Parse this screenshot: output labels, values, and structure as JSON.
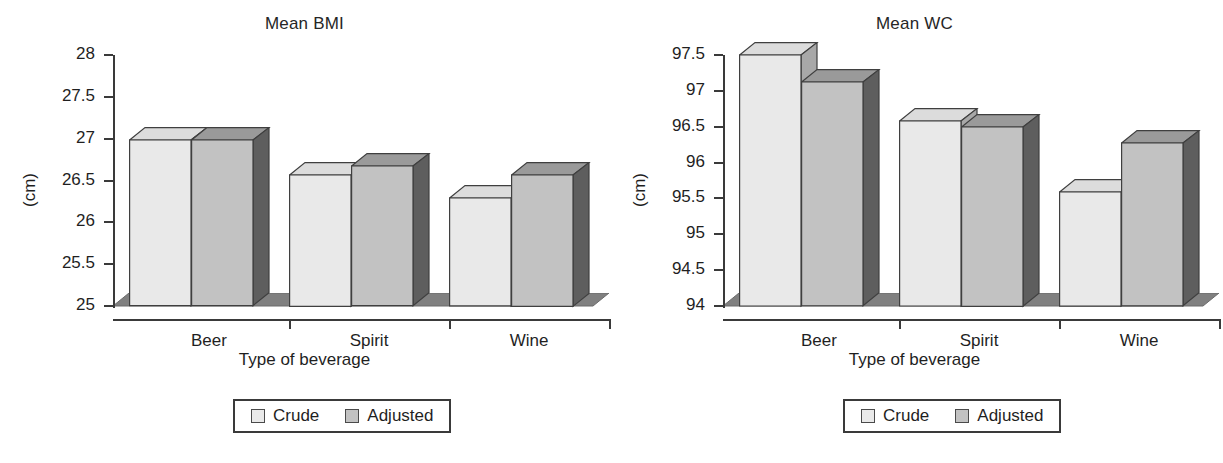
{
  "figure": {
    "width": 1219,
    "height": 463,
    "background": "#ffffff"
  },
  "colors": {
    "crude_face": "#e9e9e9",
    "crude_side": "#a8a8a8",
    "crude_top": "#dcdcdc",
    "adjusted_face": "#c2c2c2",
    "adjusted_side": "#5e5e5e",
    "adjusted_top": "#9a9a9a",
    "axis": "#3a3a3a",
    "text": "#1f1f1f",
    "floor_front": "#d6d6d6",
    "floor_side": "#808080"
  },
  "legend": {
    "entries": [
      {
        "label": "Crude",
        "swatch": "crude"
      },
      {
        "label": "Adjusted",
        "swatch": "adjusted"
      }
    ]
  },
  "chart_data": [
    {
      "id": "bmi",
      "type": "bar",
      "title": "Mean BMI",
      "xlabel": "Type of beverage",
      "ylabel": "(cm)",
      "categories": [
        "Beer",
        "Spirit",
        "Wine"
      ],
      "yticks": [
        25,
        25.5,
        26,
        26.5,
        27,
        27.5,
        28
      ],
      "ytick_labels": [
        "25",
        "25.5",
        "26",
        "26.5",
        "27",
        "27.5",
        "28"
      ],
      "ylim": [
        25,
        28
      ],
      "grid": false,
      "legend_position": "bottom-center",
      "series": [
        {
          "name": "Crude",
          "values": [
            26.98,
            26.57,
            26.29
          ]
        },
        {
          "name": "Adjusted",
          "values": [
            26.98,
            26.67,
            26.57
          ]
        }
      ]
    },
    {
      "id": "wc",
      "type": "bar",
      "title": "Mean WC",
      "xlabel": "Type of beverage",
      "ylabel": "(cm)",
      "categories": [
        "Beer",
        "Spirit",
        "Wine"
      ],
      "yticks": [
        94,
        94.5,
        95,
        95.5,
        96,
        96.5,
        97,
        97.5
      ],
      "ytick_labels": [
        "94",
        "94.5",
        "95",
        "95.5",
        "96",
        "96.5",
        "97",
        "97.5"
      ],
      "ylim": [
        94,
        97.5
      ],
      "grid": false,
      "legend_position": "bottom-center",
      "series": [
        {
          "name": "Crude",
          "values": [
            97.5,
            96.58,
            95.59
          ]
        },
        {
          "name": "Adjusted",
          "values": [
            97.12,
            96.5,
            96.27
          ]
        }
      ]
    }
  ]
}
